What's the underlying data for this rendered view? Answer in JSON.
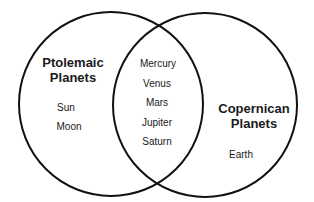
{
  "diagram": {
    "type": "venn",
    "colors": {
      "stroke": "#111111",
      "text": "#1a1a1a",
      "background": "#ffffff"
    },
    "sets": [
      {
        "id": "ptolemaic",
        "title_line1": "Ptolemaic",
        "title_line2": "Planets",
        "exclusive_items": [
          "Sun",
          "Moon"
        ]
      },
      {
        "id": "copernican",
        "title_line1": "Copernican",
        "title_line2": "Planets",
        "exclusive_items": [
          "Earth"
        ]
      }
    ],
    "intersection_items": [
      "Mercury",
      "Venus",
      "Mars",
      "Jupiter",
      "Saturn"
    ]
  }
}
